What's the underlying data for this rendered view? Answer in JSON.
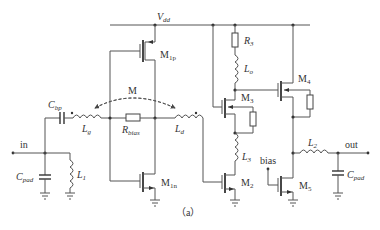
{
  "diagram": {
    "caption": "（a）",
    "supply": {
      "label": "V",
      "sub": "dd"
    },
    "ports": {
      "input": "in",
      "output": "out",
      "bias": "bias"
    },
    "coupling": {
      "label": "M"
    },
    "transistors": [
      {
        "id": "M1p",
        "label": "M",
        "sub": "1p"
      },
      {
        "id": "M1n",
        "label": "M",
        "sub": "1n"
      },
      {
        "id": "M2",
        "label": "M",
        "sub": "2"
      },
      {
        "id": "M3",
        "label": "M",
        "sub": "3"
      },
      {
        "id": "M4",
        "label": "M",
        "sub": "4"
      },
      {
        "id": "M5",
        "label": "M",
        "sub": "5"
      }
    ],
    "inductors": [
      {
        "id": "Lg",
        "label": "L",
        "sub": "g"
      },
      {
        "id": "Ld",
        "label": "L",
        "sub": "d"
      },
      {
        "id": "L1",
        "label": "L",
        "sub": "1"
      },
      {
        "id": "L2",
        "label": "L",
        "sub": "2"
      },
      {
        "id": "L3",
        "label": "L",
        "sub": "3"
      },
      {
        "id": "Lo",
        "label": "L",
        "sub": "o"
      }
    ],
    "capacitors": [
      {
        "id": "Cbp",
        "label": "C",
        "sub": "bp"
      },
      {
        "id": "Cpad_in",
        "label": "C",
        "sub": "pad"
      },
      {
        "id": "Cpad_out",
        "label": "C",
        "sub": "pad"
      }
    ],
    "resistors": [
      {
        "id": "Rbias",
        "label": "R",
        "sub": "bias"
      },
      {
        "id": "R3",
        "label": "R",
        "sub": "3"
      }
    ]
  }
}
